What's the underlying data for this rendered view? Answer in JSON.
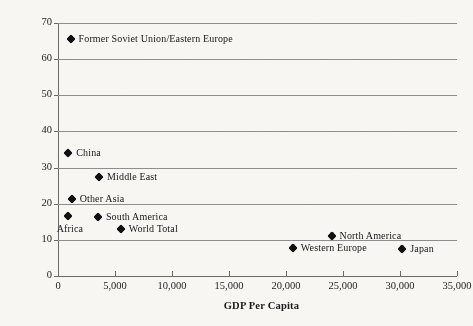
{
  "chart_data": {
    "type": "scatter",
    "title": "",
    "xlabel": "GDP Per Capita",
    "ylabel": "Thousand BTU per 1999 Dollar of GDP",
    "xlim": [
      0,
      35000
    ],
    "ylim": [
      0,
      70
    ],
    "xticks": [
      "0",
      "5,000",
      "10,000",
      "15,000",
      "20,000",
      "25,000",
      "30,000",
      "35,000"
    ],
    "xtick_values": [
      0,
      5000,
      10000,
      15000,
      20000,
      25000,
      30000,
      35000
    ],
    "yticks": [
      "0",
      "10",
      "20",
      "30",
      "40",
      "50",
      "60",
      "70"
    ],
    "ytick_values": [
      0,
      10,
      20,
      30,
      40,
      50,
      60,
      70
    ],
    "grid": "horizontal",
    "legend": "none",
    "marker": "diamond",
    "marker_color": "#111111",
    "grid_color": "#8e8e8e",
    "axis_color": "#6a6a6a",
    "background_color": "#f7f6f3",
    "points": [
      {
        "label": "Former Soviet Union/Eastern Europe",
        "x": 1100,
        "y": 65.5,
        "label_pos": "right"
      },
      {
        "label": "China",
        "x": 900,
        "y": 34.0,
        "label_pos": "right"
      },
      {
        "label": "Middle East",
        "x": 3600,
        "y": 27.3,
        "label_pos": "right"
      },
      {
        "label": "Other Asia",
        "x": 1200,
        "y": 21.2,
        "label_pos": "right"
      },
      {
        "label": "South America",
        "x": 3500,
        "y": 16.3,
        "label_pos": "right"
      },
      {
        "label": "Africa",
        "x": 850,
        "y": 16.5,
        "label_pos": "below"
      },
      {
        "label": "World Total",
        "x": 5500,
        "y": 13.0,
        "label_pos": "right"
      },
      {
        "label": "North America",
        "x": 24000,
        "y": 11.2,
        "label_pos": "right"
      },
      {
        "label": "Western Europe",
        "x": 20600,
        "y": 7.8,
        "label_pos": "right"
      },
      {
        "label": "Japan",
        "x": 30200,
        "y": 7.5,
        "label_pos": "right"
      }
    ]
  }
}
